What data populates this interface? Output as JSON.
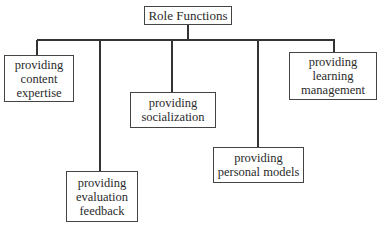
{
  "diagram": {
    "type": "hierarchy",
    "root": {
      "label": "Role Functions"
    },
    "children": [
      {
        "label": "providing\ncontent\nexpertise"
      },
      {
        "label": "providing\nevaluation\nfeedback"
      },
      {
        "label": "providing\nsocialization"
      },
      {
        "label": "providing\npersonal models"
      },
      {
        "label": "providing\nlearning\nmanagement"
      }
    ],
    "colors": {
      "line": "#333333",
      "border": "#444444",
      "background": "#ffffff",
      "text": "#2a2a2a"
    }
  }
}
